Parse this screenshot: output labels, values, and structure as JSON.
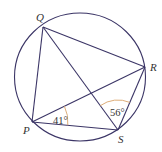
{
  "diagram": {
    "type": "cyclic-quadrilateral",
    "colors": {
      "line": "#3b3566",
      "arc": "#d9a46a",
      "text": "#333333"
    },
    "circle": {
      "cx": 80,
      "cy": 77,
      "rx": 65.5,
      "ry": 64
    },
    "points": {
      "Q": {
        "label": "Q",
        "x": 43,
        "y": 27,
        "lx": 36,
        "ly": 21
      },
      "R": {
        "label": "R",
        "x": 145,
        "y": 67,
        "lx": 150,
        "ly": 71
      },
      "P": {
        "label": "P",
        "x": 32,
        "y": 122,
        "lx": 23,
        "ly": 134
      },
      "S": {
        "label": "S",
        "x": 118,
        "y": 130,
        "lx": 118,
        "ly": 143
      }
    },
    "segments": [
      "QR",
      "QP",
      "QS",
      "PR",
      "PS",
      "RS"
    ],
    "angles": [
      {
        "at": "P",
        "between": [
          "PS",
          "PR"
        ],
        "label": "41°",
        "lx": 53,
        "ly": 124
      },
      {
        "at": "S",
        "between": [
          "SQ",
          "SR"
        ],
        "label": "56°",
        "lx": 110,
        "ly": 116
      }
    ]
  }
}
